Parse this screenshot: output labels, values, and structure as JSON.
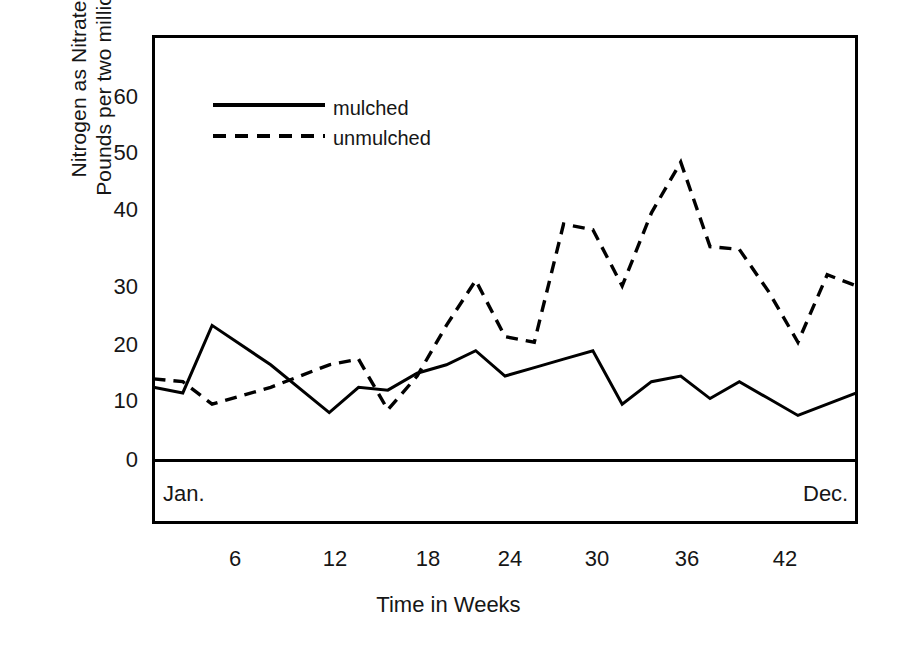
{
  "chart_data": {
    "type": "line",
    "title": "",
    "xlabel": "Time in Weeks",
    "ylabel": "Nitrogen as Nitrate Pounds per two million",
    "ylabel_lines": [
      "Nitrogen as Nitrate",
      "Pounds per two million"
    ],
    "ylim": [
      0,
      65
    ],
    "xlim": [
      0,
      48
    ],
    "yticks": [
      0,
      10,
      20,
      30,
      40,
      50,
      60
    ],
    "xticks": [
      6,
      12,
      18,
      24,
      30,
      36,
      42
    ],
    "grid": false,
    "legend_position": "upper-left-inside",
    "period_band": {
      "start_label": "Jan.",
      "end_label": "Dec."
    },
    "series": [
      {
        "name": "mulched",
        "style": "solid",
        "color": "#000000",
        "x": [
          0,
          2,
          4,
          8,
          12,
          14,
          16,
          18,
          20,
          22,
          24,
          26,
          28,
          30,
          32,
          34,
          36,
          38,
          40,
          42,
          44,
          48
        ],
        "values": [
          13,
          12,
          24,
          17,
          8.5,
          13,
          12.5,
          15.5,
          17,
          19.5,
          15,
          16.5,
          18,
          19.5,
          10,
          14,
          15,
          11,
          14,
          11,
          8,
          12
        ]
      },
      {
        "name": "unmulched",
        "style": "dashed",
        "color": "#000000",
        "x": [
          0,
          2,
          4,
          8,
          12,
          14,
          16,
          18,
          20,
          22,
          24,
          26,
          28,
          30,
          32,
          34,
          36,
          38,
          40,
          42,
          44,
          46,
          48
        ],
        "values": [
          14.5,
          14,
          10,
          13,
          17,
          18,
          9,
          15,
          24,
          32,
          22,
          21,
          42,
          41,
          31,
          44,
          53,
          38,
          37.5,
          30,
          21,
          33,
          31
        ]
      }
    ]
  },
  "legend": {
    "items": [
      {
        "label": "mulched",
        "style": "solid"
      },
      {
        "label": "unmulched",
        "style": "dashed"
      }
    ]
  },
  "axes": {
    "y_title_line1": "Nitrogen as Nitrate",
    "y_title_line2": "Pounds per two million",
    "x_title": "Time in Weeks",
    "y_tick_labels": [
      "60",
      "50",
      "40",
      "30",
      "20",
      "10",
      "0"
    ],
    "x_tick_labels": [
      "6",
      "12",
      "18",
      "24",
      "30",
      "36",
      "42"
    ]
  },
  "band": {
    "start": "Jan.",
    "end": "Dec."
  },
  "colors": {
    "ink": "#000000",
    "background": "#ffffff",
    "text": "#161616"
  }
}
